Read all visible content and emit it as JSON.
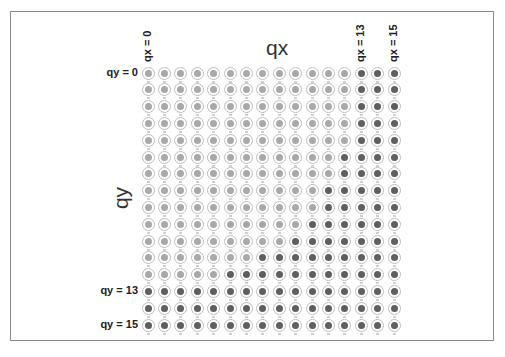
{
  "diagram": {
    "x_axis_title": "qx",
    "y_axis_title": "qy",
    "column_labels": [
      {
        "text": "qx = 0",
        "col": 0
      },
      {
        "text": "qx = 13",
        "col": 13
      },
      {
        "text": "qx = 15",
        "col": 15
      }
    ],
    "row_labels": [
      {
        "text": "qy = 0",
        "row": 0
      },
      {
        "text": "qy = 13",
        "row": 13
      },
      {
        "text": "qy = 15",
        "row": 15
      }
    ],
    "grid": {
      "rows": 16,
      "cols": 16,
      "dark_start_col_per_row": [
        13,
        13,
        13,
        13,
        13,
        12,
        12,
        11,
        11,
        10,
        9,
        7,
        5,
        0,
        0,
        0
      ]
    },
    "colors": {
      "light_fill": "#a9a9a9",
      "dark_fill": "#5f5f5f",
      "ring": "#bdbdbd",
      "frame_border": "#8a8a8a"
    }
  }
}
